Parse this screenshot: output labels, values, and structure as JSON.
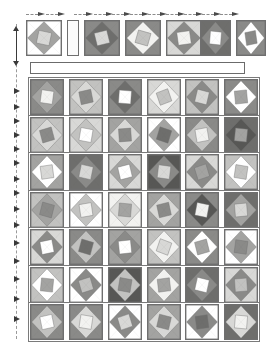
{
  "document": {
    "kind": "quilt-layout-diagram",
    "title": "",
    "page_width": 267,
    "page_height": 355
  },
  "palette": {
    "white": "#ffffff",
    "offwhite": "#f2f2f0",
    "light": "#d8d8d6",
    "light_mid": "#c2c2c0",
    "mid": "#a3a3a1",
    "mid_dark": "#8a8a88",
    "dark": "#6e6e6c",
    "darker": "#575755",
    "outline": "#6f6f6f",
    "rail": "#9a9a9a",
    "arrow": "#3a3a3a"
  },
  "geometry": {
    "grid_left": 30,
    "grid_right": 258,
    "block_size": 33,
    "gap_x": 5,
    "row_gap": 4
  },
  "top_row": {
    "name": "header-block-row",
    "y": 20,
    "height": 36,
    "blocks": [
      {
        "x": 26,
        "w": 36,
        "bg": "#ffffff",
        "diamond": "#a3a3a1",
        "center": "#d8d8d6",
        "rot": 12
      },
      {
        "x": 67,
        "w": 12,
        "bg": "#fbfbfb",
        "diamond": "#fbfbfb",
        "center": "#fbfbfb",
        "rot": 0,
        "filler": true
      },
      {
        "x": 84,
        "w": 36,
        "bg": "#8a8a88",
        "diamond": "#6e6e6c",
        "center": "#d8d8d6",
        "rot": -14
      },
      {
        "x": 125,
        "w": 36,
        "bg": "#8a8a88",
        "diamond": "#f2f2f0",
        "center": "#c2c2c0",
        "rot": 16
      },
      {
        "x": 166,
        "w": 36,
        "bg": "#d8d8d6",
        "diamond": "#8a8a88",
        "center": "#f2f2f0",
        "rot": -8
      },
      {
        "x": 200,
        "w": 31,
        "bg": "#6e6e6c",
        "diamond": "#8a8a88",
        "center": "#ffffff",
        "rot": 5
      },
      {
        "x": 236,
        "w": 30,
        "bg": "#8a8a88",
        "diamond": "#ffffff",
        "center": "#8a8a88",
        "rot": -10
      }
    ]
  },
  "sashing_bar": {
    "name": "empty-sashing-strip",
    "x": 30,
    "y": 62,
    "w": 215,
    "h": 12
  },
  "grid": {
    "name": "main-block-grid",
    "top": 79,
    "row_height": 36,
    "row_pitch": 37.5,
    "columns": 6,
    "rows": [
      {
        "index": 0,
        "blocks": [
          {
            "bg": "#8a8a88",
            "diamond": "#a3a3a1",
            "center": "#f2f2f0",
            "rot": 8
          },
          {
            "bg": "#c2c2c0",
            "diamond": "#d8d8d6",
            "center": "#8a8a88",
            "rot": -12
          },
          {
            "bg": "#8a8a88",
            "diamond": "#6e6e6c",
            "center": "#ffffff",
            "rot": 4
          },
          {
            "bg": "#d8d8d6",
            "diamond": "#f2f2f0",
            "center": "#c2c2c0",
            "rot": -20
          },
          {
            "bg": "#c2c2c0",
            "diamond": "#8a8a88",
            "center": "#d8d8d6",
            "rot": 14
          },
          {
            "bg": "#8a8a88",
            "diamond": "#ffffff",
            "center": "#a3a3a1",
            "rot": -6
          }
        ]
      },
      {
        "index": 1,
        "blocks": [
          {
            "bg": "#c2c2c0",
            "diamond": "#d8d8d6",
            "center": "#8a8a88",
            "rot": -16
          },
          {
            "bg": "#d8d8d6",
            "diamond": "#c2c2c0",
            "center": "#ffffff",
            "rot": 10
          },
          {
            "bg": "#a3a3a1",
            "diamond": "#d8d8d6",
            "center": "#8a8a88",
            "rot": -4
          },
          {
            "bg": "#ffffff",
            "diamond": "#a3a3a1",
            "center": "#6e6e6c",
            "rot": 18
          },
          {
            "bg": "#8a8a88",
            "diamond": "#c2c2c0",
            "center": "#f2f2f0",
            "rot": -10
          },
          {
            "bg": "#6e6e6c",
            "diamond": "#575755",
            "center": "#a3a3a1",
            "rot": 6
          }
        ]
      },
      {
        "index": 2,
        "blocks": [
          {
            "bg": "#a3a3a1",
            "diamond": "#ffffff",
            "center": "#d8d8d6",
            "rot": -8
          },
          {
            "bg": "#6e6e6c",
            "diamond": "#8a8a88",
            "center": "#d8d8d6",
            "rot": 12
          },
          {
            "bg": "#d8d8d6",
            "diamond": "#a3a3a1",
            "center": "#ffffff",
            "rot": -14
          },
          {
            "bg": "#575755",
            "diamond": "#8a8a88",
            "center": "#d8d8d6",
            "rot": 7
          },
          {
            "bg": "#d8d8d6",
            "diamond": "#8a8a88",
            "center": "#a3a3a1",
            "rot": -18
          },
          {
            "bg": "#c2c2c0",
            "diamond": "#ffffff",
            "center": "#c2c2c0",
            "rot": 9
          }
        ]
      },
      {
        "index": 3,
        "blocks": [
          {
            "bg": "#c2c2c0",
            "diamond": "#a3a3a1",
            "center": "#8a8a88",
            "rot": 15
          },
          {
            "bg": "#ffffff",
            "diamond": "#c2c2c0",
            "center": "#f2f2f0",
            "rot": -9
          },
          {
            "bg": "#f2f2f0",
            "diamond": "#d8d8d6",
            "center": "#a3a3a1",
            "rot": 5
          },
          {
            "bg": "#a3a3a1",
            "diamond": "#d8d8d6",
            "center": "#8a8a88",
            "rot": -13
          },
          {
            "bg": "#8a8a88",
            "diamond": "#575755",
            "center": "#f2f2f0",
            "rot": 11
          },
          {
            "bg": "#6e6e6c",
            "diamond": "#a3a3a1",
            "center": "#d8d8d6",
            "rot": -5
          }
        ]
      },
      {
        "index": 4,
        "blocks": [
          {
            "bg": "#d8d8d6",
            "diamond": "#8a8a88",
            "center": "#ffffff",
            "rot": -11
          },
          {
            "bg": "#8a8a88",
            "diamond": "#c2c2c0",
            "center": "#6e6e6c",
            "rot": 16
          },
          {
            "bg": "#a3a3a1",
            "diamond": "#8a8a88",
            "center": "#ffffff",
            "rot": -6
          },
          {
            "bg": "#c2c2c0",
            "diamond": "#f2f2f0",
            "center": "#d8d8d6",
            "rot": 20
          },
          {
            "bg": "#8a8a88",
            "diamond": "#ffffff",
            "center": "#a3a3a1",
            "rot": -15
          },
          {
            "bg": "#ffffff",
            "diamond": "#a3a3a1",
            "center": "#8a8a88",
            "rot": 8
          }
        ]
      },
      {
        "index": 5,
        "blocks": [
          {
            "bg": "#c2c2c0",
            "diamond": "#ffffff",
            "center": "#a3a3a1",
            "rot": 6
          },
          {
            "bg": "#ffffff",
            "diamond": "#8a8a88",
            "center": "#c2c2c0",
            "rot": -17
          },
          {
            "bg": "#575755",
            "diamond": "#c2c2c0",
            "center": "#8a8a88",
            "rot": 10
          },
          {
            "bg": "#a3a3a1",
            "diamond": "#f2f2f0",
            "center": "#a3a3a1",
            "rot": -7
          },
          {
            "bg": "#6e6e6c",
            "diamond": "#8a8a88",
            "center": "#ffffff",
            "rot": 13
          },
          {
            "bg": "#d8d8d6",
            "diamond": "#8a8a88",
            "center": "#c2c2c0",
            "rot": -4
          }
        ]
      },
      {
        "index": 6,
        "blocks": [
          {
            "bg": "#8a8a88",
            "diamond": "#c2c2c0",
            "center": "#ffffff",
            "rot": -12
          },
          {
            "bg": "#8a8a88",
            "diamond": "#d8d8d6",
            "center": "#f2f2f0",
            "rot": 9
          },
          {
            "bg": "#ffffff",
            "diamond": "#8a8a88",
            "center": "#d8d8d6",
            "rot": -18
          },
          {
            "bg": "#a3a3a1",
            "diamond": "#d8d8d6",
            "center": "#8a8a88",
            "rot": 14
          },
          {
            "bg": "#ffffff",
            "diamond": "#8a8a88",
            "center": "#6e6e6c",
            "rot": -8
          },
          {
            "bg": "#6e6e6c",
            "diamond": "#d8d8d6",
            "center": "#f2f2f0",
            "rot": 5
          }
        ]
      }
    ]
  },
  "annotations": {
    "top_arrows_count": 11,
    "left_arrows_count": 14,
    "arrow_icon": "arrow-right-icon",
    "guide_style": "dashed"
  }
}
